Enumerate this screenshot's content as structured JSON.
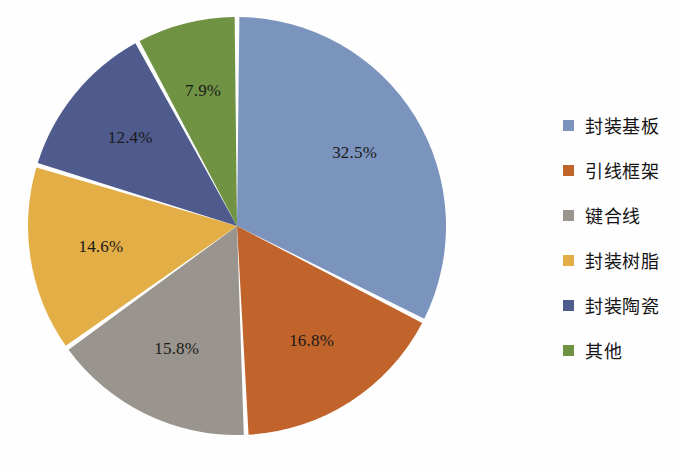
{
  "chart_data": {
    "type": "pie",
    "title": "",
    "subtitle": "",
    "xlabel": "",
    "ylabel": "",
    "grid": false,
    "legend_position": "right",
    "start_angle_deg": 0,
    "direction": "clockwise",
    "categories": [
      "封装基板",
      "引线框架",
      "键合线",
      "封装树脂",
      "封装陶瓷",
      "其他"
    ],
    "values": [
      32.5,
      16.8,
      15.8,
      14.6,
      12.4,
      7.9
    ],
    "value_unit": "%",
    "data_labels": [
      "32.5%",
      "16.8%",
      "15.8%",
      "14.6%",
      "12.4%",
      "7.9%"
    ],
    "colors": [
      "#7B94BD",
      "#C1642B",
      "#9A948E",
      "#E3AE46",
      "#4E5B8C",
      "#6F9343"
    ],
    "slices": [
      {
        "label": "封装基板",
        "value": 32.5,
        "data_label": "32.5%",
        "color": "#7B94BD"
      },
      {
        "label": "引线框架",
        "value": 16.8,
        "data_label": "16.8%",
        "color": "#C1642B"
      },
      {
        "label": "键合线",
        "value": 15.8,
        "data_label": "15.8%",
        "color": "#9A948E"
      },
      {
        "label": "封装树脂",
        "value": 14.6,
        "data_label": "14.6%",
        "color": "#E3AE46"
      },
      {
        "label": "封装陶瓷",
        "value": 12.4,
        "data_label": "12.4%",
        "color": "#4E5B8C"
      },
      {
        "label": "其他",
        "value": 7.9,
        "data_label": "7.9%",
        "color": "#6F9343"
      }
    ]
  },
  "legend": {
    "items": [
      {
        "label": "封装基板",
        "color": "#7B94BD"
      },
      {
        "label": "引线框架",
        "color": "#C1642B"
      },
      {
        "label": "键合线",
        "color": "#9A948E"
      },
      {
        "label": "封装树脂",
        "color": "#E3AE46"
      },
      {
        "label": "封装陶瓷",
        "color": "#4E5B8C"
      },
      {
        "label": "其他",
        "color": "#6F9343"
      }
    ]
  },
  "caption": {
    "text": ""
  }
}
